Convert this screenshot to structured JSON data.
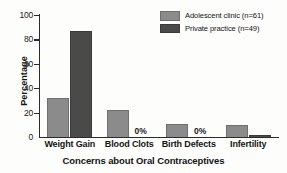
{
  "chart_data": {
    "type": "bar",
    "title": "",
    "xlabel": "Concerns about Oral Contraceptives",
    "ylabel": "Percentage",
    "categories": [
      "Weight Gain",
      "Blood Clots",
      "Birth Defects",
      "Infertility"
    ],
    "series": [
      {
        "name": "Adolescent clinic (n=61)",
        "color": "#8b8b8b",
        "values": [
          32,
          22,
          11,
          10
        ]
      },
      {
        "name": "Private practice (n=49)",
        "color": "#4a4a4a",
        "values": [
          87,
          0,
          0,
          2
        ]
      }
    ],
    "ylim": [
      0,
      100
    ],
    "yticks": [
      0,
      20,
      40,
      60,
      80,
      100
    ],
    "ytick_labels": [
      "0",
      "20",
      "40",
      "60",
      "80",
      "100"
    ],
    "grid": false,
    "legend_position": "top-right",
    "annotations": [
      {
        "text": "0%",
        "category": "Blood Clots",
        "series": "Private practice (n=49)"
      },
      {
        "text": "0%",
        "category": "Birth Defects",
        "series": "Private practice (n=49)"
      }
    ]
  }
}
